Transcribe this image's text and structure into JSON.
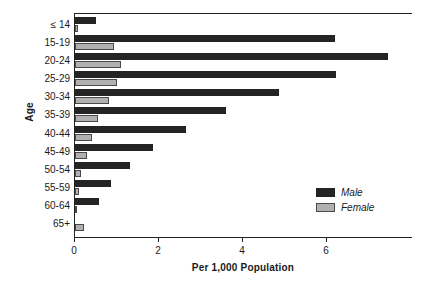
{
  "chart_data": {
    "type": "bar",
    "orientation": "horizontal",
    "title": "",
    "xlabel": "Per 1,000 Population",
    "ylabel": "Age",
    "categories": [
      "≤ 14",
      "15-19",
      "20-24",
      "25-29",
      "30-34",
      "35-39",
      "40-44",
      "45-49",
      "50-54",
      "55-59",
      "60-64",
      "65+"
    ],
    "series": [
      {
        "name": "Male",
        "color": "#242424",
        "values": [
          0.5,
          6.2,
          7.45,
          6.22,
          4.85,
          3.6,
          2.65,
          1.85,
          1.3,
          0.85,
          0.57,
          0.0
        ]
      },
      {
        "name": "Female",
        "color": "#b0b0b0",
        "values": [
          0.08,
          0.93,
          1.1,
          1.0,
          0.82,
          0.55,
          0.4,
          0.28,
          0.15,
          0.1,
          0.05,
          0.22
        ]
      }
    ],
    "xlim": [
      0,
      8.05
    ],
    "xticks": [
      0,
      2,
      4,
      6
    ],
    "xtick_labels": [
      "0",
      "2",
      "4",
      "6"
    ],
    "grid": false,
    "legend_position": "bottom-right",
    "legend_entries": [
      "Male",
      "Female"
    ]
  },
  "axes": {
    "y_title": "Age",
    "x_title": "Per 1,000 Population"
  },
  "legend": {
    "male_label": "Male",
    "female_label": "Female"
  }
}
